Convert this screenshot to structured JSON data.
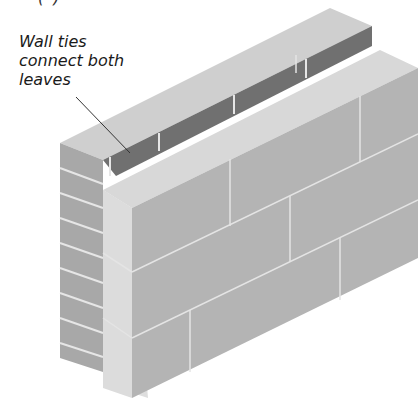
{
  "diagram": {
    "title_fragment": "(   )",
    "annotation": {
      "lines": [
        "Wall ties",
        "connect both",
        "leaves"
      ]
    },
    "parts": {
      "outer_leaf": "brick leaf",
      "inner_leaf": "block leaf",
      "cavity": "cavity with wall ties"
    },
    "colors": {
      "brick_face": "#a9a9a9",
      "brick_top": "#cfcfcf",
      "brick_inner": "#6f6f6f",
      "block_face": "#b5b5b5",
      "block_side": "#dcdcdc",
      "block_top": "#d6d6d6",
      "mortar": "#e8e8e8",
      "leader_line": "#333333"
    }
  }
}
